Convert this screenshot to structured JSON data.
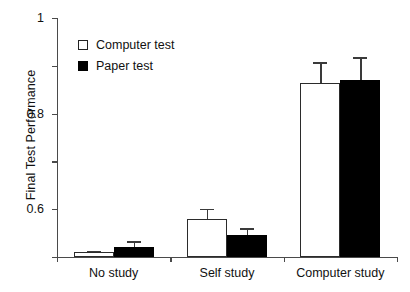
{
  "chart_data": {
    "type": "bar",
    "title": "",
    "xlabel": "",
    "ylabel": "Final Test Performance",
    "categories": [
      "No study",
      "Self study",
      "Computer study"
    ],
    "ylim": [
      0,
      1
    ],
    "yticks": [
      0,
      0.2,
      0.4,
      0.6,
      0.8,
      1
    ],
    "ytick_labels": [
      "0",
      "0.2",
      "0.4",
      "0.6",
      "0.8",
      "1"
    ],
    "grid": false,
    "legend_position": "upper-left-inside",
    "series": [
      {
        "name": "Computer test",
        "style": "open",
        "color": "#ffffff",
        "edge_color": "#2b2b2b",
        "values": [
          0.02,
          0.16,
          0.73
        ],
        "errors": [
          0.005,
          0.04,
          0.085
        ]
      },
      {
        "name": "Paper test",
        "style": "filled",
        "color": "#000000",
        "edge_color": "#000000",
        "values": [
          0.04,
          0.09,
          0.74
        ],
        "errors": [
          0.025,
          0.03,
          0.095
        ]
      }
    ]
  },
  "legend": {
    "items": [
      {
        "label": "Computer test",
        "swatch": "open-square-swatch"
      },
      {
        "label": "Paper test",
        "swatch": "filled-square-swatch"
      }
    ]
  },
  "axes": {
    "y_label": "Final Test Performance",
    "y_ticks": [
      "0",
      "0.2",
      "0.4",
      "0.6",
      "0.8",
      "1"
    ],
    "x_ticks": [
      "No study",
      "Self study",
      "Computer study"
    ]
  }
}
